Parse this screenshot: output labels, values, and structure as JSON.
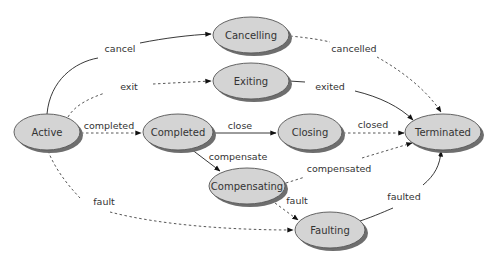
{
  "diagram": {
    "type": "state-machine",
    "nodes": {
      "active": {
        "label": "Active",
        "cx": 47,
        "cy": 132,
        "rx": 33,
        "ry": 18
      },
      "cancelling": {
        "label": "Cancelling",
        "cx": 251,
        "cy": 35,
        "rx": 38,
        "ry": 18
      },
      "exiting": {
        "label": "Exiting",
        "cx": 251,
        "cy": 81,
        "rx": 38,
        "ry": 18
      },
      "completed": {
        "label": "Completed",
        "cx": 178,
        "cy": 132,
        "rx": 35,
        "ry": 18
      },
      "closing": {
        "label": "Closing",
        "cx": 310,
        "cy": 132,
        "rx": 32,
        "ry": 18
      },
      "terminated": {
        "label": "Terminated",
        "cx": 443,
        "cy": 132,
        "rx": 38,
        "ry": 18
      },
      "compensating": {
        "label": "Compensating",
        "cx": 247,
        "cy": 186,
        "rx": 38,
        "ry": 18
      },
      "faulting": {
        "label": "Faulting",
        "cx": 330,
        "cy": 230,
        "rx": 35,
        "ry": 18
      }
    },
    "edges": {
      "cancel": {
        "label": "cancel",
        "from": "Active",
        "to": "Cancelling",
        "style": "solid"
      },
      "exit": {
        "label": "exit",
        "from": "Active",
        "to": "Exiting",
        "style": "dashed"
      },
      "completed": {
        "label": "completed",
        "from": "Active",
        "to": "Completed",
        "style": "dashed"
      },
      "fault_active": {
        "label": "fault",
        "from": "Active",
        "to": "Faulting",
        "style": "dashed"
      },
      "cancelled": {
        "label": "cancelled",
        "from": "Cancelling",
        "to": "Terminated",
        "style": "dashed"
      },
      "exited": {
        "label": "exited",
        "from": "Exiting",
        "to": "Terminated",
        "style": "solid"
      },
      "close": {
        "label": "close",
        "from": "Completed",
        "to": "Closing",
        "style": "solid"
      },
      "compensate": {
        "label": "compensate",
        "from": "Completed",
        "to": "Compensating",
        "style": "solid"
      },
      "closed": {
        "label": "closed",
        "from": "Closing",
        "to": "Terminated",
        "style": "dashed"
      },
      "compensated": {
        "label": "compensated",
        "from": "Compensating",
        "to": "Terminated",
        "style": "dashed"
      },
      "fault_compensating": {
        "label": "fault",
        "from": "Compensating",
        "to": "Faulting",
        "style": "dashed"
      },
      "faulted": {
        "label": "faulted",
        "from": "Faulting",
        "to": "Terminated",
        "style": "solid"
      }
    },
    "colors": {
      "node_fill": "#d4d4d4",
      "node_stroke": "#555555",
      "node_shadow": "#6e6e6e",
      "edge": "#222222",
      "text": "#333333"
    }
  }
}
